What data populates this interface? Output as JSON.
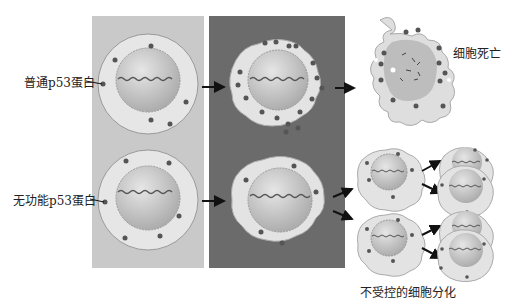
{
  "labels": {
    "normal_p53": "普通p53蛋白",
    "nonfunctional_p53": "无功能p53蛋白",
    "cell_death": "细胞死亡",
    "uncontrolled_division": "不受控的细胞分化"
  },
  "colors": {
    "panel_light": "#c8c8c8",
    "panel_dark": "#6a6a6a",
    "cytoplasm": "#e4e4e4",
    "nucleus": "#bdbdbd",
    "protein_dot": "#555555",
    "arrow": "#111111"
  }
}
